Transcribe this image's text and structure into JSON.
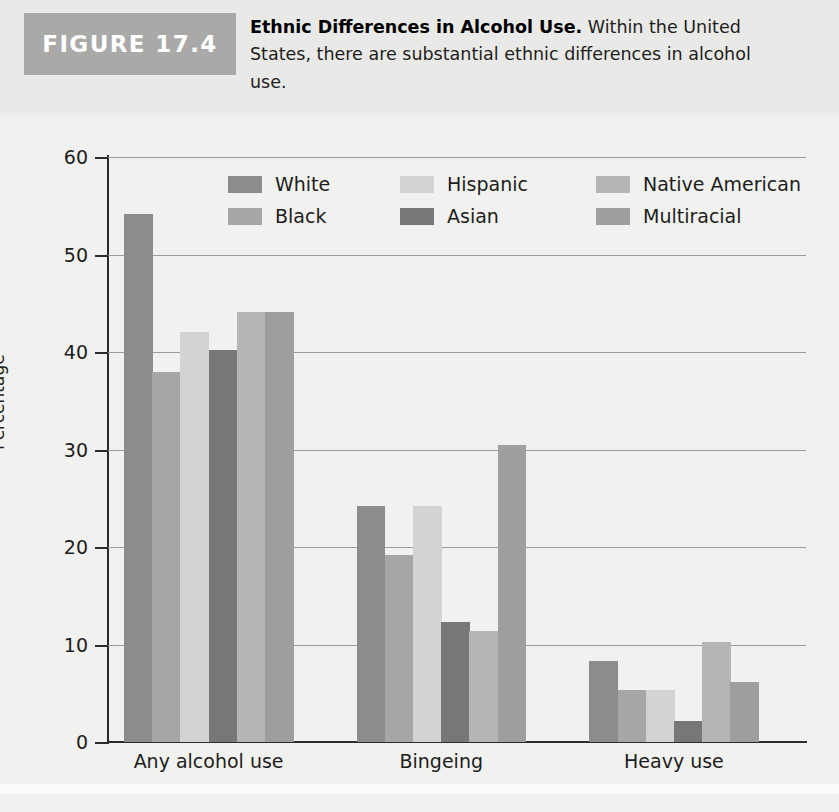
{
  "figure": {
    "badge_label": "FIGURE 17.4",
    "caption_title": "Ethnic Differences in Alcohol Use.",
    "caption_body": " Within the United States, there are substantial ethnic differences in alcohol use."
  },
  "colors": {
    "badge_bg": "#a9a9a7",
    "panel_bg": "#f1f1ef",
    "header_bg": "#e9e9e7",
    "axis": "#2b2b2b",
    "gridline": "#9c9c9a",
    "white_series": "#8c8c8c",
    "black_series": "#a6a6a6",
    "hispanic_series": "#d3d3d3",
    "asian_series": "#777777",
    "native_american_series": "#b5b5b5",
    "multiracial_series": "#9e9e9e"
  },
  "legend": {
    "rows": [
      [
        {
          "label": "White",
          "color": "#8c8c8c"
        },
        {
          "label": "Hispanic",
          "color": "#d3d3d3"
        },
        {
          "label": "Native American",
          "color": "#b5b5b5"
        }
      ],
      [
        {
          "label": "Black",
          "color": "#a6a6a6"
        },
        {
          "label": "Asian",
          "color": "#777777"
        },
        {
          "label": "Multiracial",
          "color": "#9e9e9e"
        }
      ]
    ]
  },
  "chart_data": {
    "type": "bar",
    "title": "Ethnic Differences in Alcohol Use",
    "xlabel": "",
    "ylabel": "Percentage",
    "ylim": [
      0,
      60
    ],
    "yticks": [
      0,
      10,
      20,
      30,
      40,
      50,
      60
    ],
    "ytick_labels": [
      "0",
      "10",
      "20",
      "30",
      "40",
      "50",
      "60"
    ],
    "grid": true,
    "legend_position": "inside-top",
    "categories": [
      "Any alcohol use",
      "Bingeing",
      "Heavy use"
    ],
    "series": [
      {
        "name": "White",
        "color": "#8c8c8c",
        "values": [
          54.2,
          24.2,
          8.3
        ]
      },
      {
        "name": "Black",
        "color": "#a6a6a6",
        "values": [
          38.0,
          19.2,
          5.3
        ]
      },
      {
        "name": "Hispanic",
        "color": "#d3d3d3",
        "values": [
          42.1,
          24.2,
          5.3
        ]
      },
      {
        "name": "Asian",
        "color": "#777777",
        "values": [
          40.2,
          12.3,
          2.2
        ]
      },
      {
        "name": "Native American",
        "color": "#b5b5b5",
        "values": [
          44.1,
          11.4,
          10.3
        ]
      },
      {
        "name": "Multiracial",
        "color": "#9e9e9e",
        "values": [
          44.1,
          30.5,
          6.2
        ]
      }
    ]
  }
}
